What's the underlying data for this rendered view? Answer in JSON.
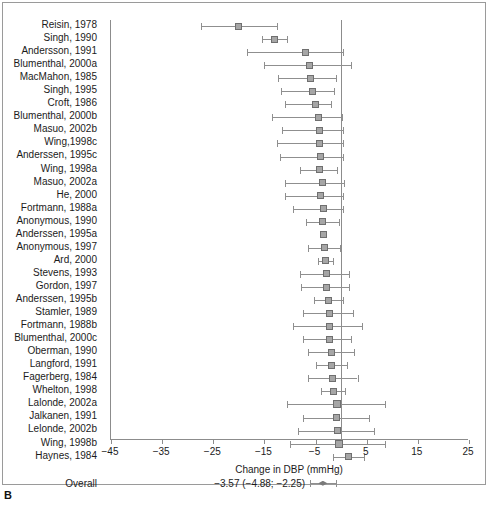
{
  "panel": {
    "letter": "B"
  },
  "axis": {
    "title": "Change in DBP (mmHg)",
    "ticks": [
      -45,
      -35,
      -25,
      -15,
      -5,
      5,
      15,
      25
    ],
    "tick_labels": [
      "−45",
      "−35",
      "−25",
      "−15",
      "−5",
      "5",
      "15",
      "25"
    ],
    "min": -45,
    "max": 25,
    "reference_value": 0
  },
  "overall": {
    "label": "Overall",
    "summary_text": "−3.57 (−4.88; −2.25)",
    "estimate": -3.57,
    "ci_low": -4.88,
    "ci_high": -2.25
  },
  "colors": {
    "marker_fill": "#a6a6a6",
    "marker_stroke": "#6f6f6f",
    "line": "#8f8f8f",
    "axis": "#8c8c8c",
    "frame": "#9a9a9a",
    "text": "#1b1b1b"
  },
  "chart_data": {
    "type": "forest",
    "title": "",
    "xlabel": "Change in DBP (mmHg)",
    "ylabel": "",
    "xlim": [
      -45,
      25
    ],
    "grid": false,
    "legend": "none",
    "reference_line": 0,
    "categories": [
      "Reisin, 1978",
      "Singh, 1990",
      "Andersson, 1991",
      "Blumenthal, 2000a",
      "MacMahon, 1985",
      "Singh, 1995",
      "Croft, 1986",
      "Blumenthal, 2000b",
      "Masuo, 2002b",
      "Wing,1998c",
      "Anderssen, 1995c",
      "Wing, 1998a",
      "Masuo, 2002a",
      "He, 2000",
      "Fortmann, 1988a",
      "Anonymous, 1990",
      "Anderssen, 1995a",
      "Anonymous, 1997",
      "Ard, 2000",
      "Stevens, 1993",
      "Gordon, 1997",
      "Anderssen, 1995b",
      "Stamler, 1989",
      "Fortmann, 1988b",
      "Blumenthal, 2000c",
      "Oberman, 1990",
      "Langford, 1991",
      "Fagerberg, 1984",
      "Whelton, 1998",
      "Lalonde, 2002a",
      "Jalkanen, 1991",
      "Lelonde, 2002b",
      "Wing, 1998b",
      "Haynes, 1984"
    ],
    "points": [
      {
        "study": "Reisin, 1978",
        "estimate": -20.0,
        "ci_low": -27.5,
        "ci_high": -12.5,
        "size": "m"
      },
      {
        "study": "Singh, 1990",
        "estimate": -13.0,
        "ci_low": -15.5,
        "ci_high": -10.5,
        "size": "m"
      },
      {
        "study": "Andersson, 1991",
        "estimate": -7.0,
        "ci_low": -18.5,
        "ci_high": 0.3,
        "size": "m"
      },
      {
        "study": "Blumenthal, 2000a",
        "estimate": -6.2,
        "ci_low": -15.0,
        "ci_high": 2.0,
        "size": "m"
      },
      {
        "study": "MacMahon, 1985",
        "estimate": -6.0,
        "ci_low": -12.3,
        "ci_high": -1.0,
        "size": "m"
      },
      {
        "study": "Singh, 1995",
        "estimate": -5.6,
        "ci_low": -11.8,
        "ci_high": -1.3,
        "size": "m"
      },
      {
        "study": "Croft, 1986",
        "estimate": -5.0,
        "ci_low": -11.0,
        "ci_high": -2.0,
        "size": "m"
      },
      {
        "station": "",
        "study": "Blumenthal, 2000b",
        "estimate": -4.5,
        "ci_low": -13.5,
        "ci_high": 0.2,
        "size": "m"
      },
      {
        "study": "Masuo, 2002b",
        "estimate": -4.2,
        "ci_low": -11.5,
        "ci_high": 0.3,
        "size": "m"
      },
      {
        "study": "Wing,1998c",
        "estimate": -4.3,
        "ci_low": -12.5,
        "ci_high": 0.3,
        "size": "m"
      },
      {
        "study": "Anderssen, 1995c",
        "estimate": -4.0,
        "ci_low": -12.0,
        "ci_high": 0.3,
        "size": "m"
      },
      {
        "study": "Wing, 1998a",
        "estimate": -4.2,
        "ci_low": -8.0,
        "ci_high": -0.8,
        "size": "m"
      },
      {
        "study": "Masuo, 2002a",
        "estimate": -3.7,
        "ci_low": -11.0,
        "ci_high": 0.5,
        "size": "m"
      },
      {
        "study": "He, 2000",
        "estimate": -4.0,
        "ci_low": -11.0,
        "ci_high": 0.3,
        "size": "m"
      },
      {
        "study": "Fortmann, 1988a",
        "estimate": -3.5,
        "ci_low": -9.5,
        "ci_high": 0.3,
        "size": "m"
      },
      {
        "study": "Anonymous, 1990",
        "estimate": -3.6,
        "ci_low": -6.8,
        "ci_high": -0.5,
        "size": "m"
      },
      {
        "study": "Anderssen, 1995a",
        "estimate": -3.4,
        "ci_low": -3.4,
        "ci_high": -3.4,
        "size": "m"
      },
      {
        "study": "Anonymous, 1997",
        "estimate": -3.3,
        "ci_low": -6.5,
        "ci_high": -0.3,
        "size": "m"
      },
      {
        "study": "Ard, 2000",
        "estimate": -3.0,
        "ci_low": -4.5,
        "ci_high": -1.5,
        "size": "m"
      },
      {
        "study": "Stevens, 1993",
        "estimate": -2.8,
        "ci_low": -8.0,
        "ci_high": 1.5,
        "size": "m"
      },
      {
        "study": "Gordon, 1997",
        "estimate": -2.8,
        "ci_low": -7.8,
        "ci_high": 1.5,
        "size": "m"
      },
      {
        "study": "Anderssen, 1995b",
        "estimate": -2.5,
        "ci_low": -5.3,
        "ci_high": 0.3,
        "size": "m"
      },
      {
        "study": "Stamler, 1989",
        "estimate": -2.3,
        "ci_low": -7.5,
        "ci_high": 2.3,
        "size": "m"
      },
      {
        "study": "Fortmann, 1988b",
        "estimate": -2.2,
        "ci_low": -9.5,
        "ci_high": 4.0,
        "size": "m"
      },
      {
        "study": "Blumenthal, 2000c",
        "estimate": -2.2,
        "ci_low": -7.5,
        "ci_high": 2.0,
        "size": "m"
      },
      {
        "study": "Oberman, 1990",
        "estimate": -1.9,
        "ci_low": -6.5,
        "ci_high": 2.5,
        "size": "m"
      },
      {
        "study": "Langford, 1991",
        "estimate": -1.8,
        "ci_low": -5.0,
        "ci_high": 1.2,
        "size": "m"
      },
      {
        "study": "Fagerberg, 1984",
        "estimate": -1.7,
        "ci_low": -6.5,
        "ci_high": 3.2,
        "size": "m"
      },
      {
        "study": "Whelton, 1998",
        "estimate": -1.5,
        "ci_low": -4.0,
        "ci_high": 0.8,
        "size": "m"
      },
      {
        "study": "Lalonde, 2002a",
        "estimate": -0.8,
        "ci_low": -10.5,
        "ci_high": 8.5,
        "size": "l"
      },
      {
        "study": "Jalkanen, 1991",
        "estimate": -1.0,
        "ci_low": -7.5,
        "ci_high": 5.5,
        "size": "m"
      },
      {
        "study": "Lelonde, 2002b",
        "estimate": -0.8,
        "ci_low": -8.5,
        "ci_high": 6.5,
        "size": "m"
      },
      {
        "study": "Wing, 1998b",
        "estimate": -0.5,
        "ci_low": -10.0,
        "ci_high": 8.5,
        "size": "l"
      },
      {
        "study": "Haynes, 1984",
        "estimate": 1.5,
        "ci_low": -1.5,
        "ci_high": 4.5,
        "size": "m"
      }
    ],
    "summary": {
      "label": "Overall",
      "estimate": -3.57,
      "ci_low": -4.88,
      "ci_high": -2.25,
      "text": "−3.57 (−4.88; −2.25)"
    }
  }
}
